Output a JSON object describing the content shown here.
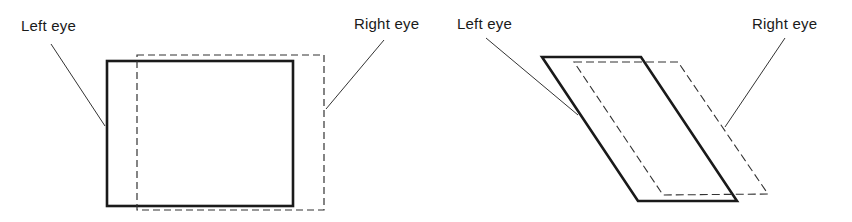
{
  "figures": [
    {
      "id": "rectangular",
      "left_label": "Left eye",
      "right_label": "Right eye"
    },
    {
      "id": "oblique",
      "left_label": "Left eye",
      "right_label": "Right eye"
    }
  ],
  "colors": {
    "line": "#1a1a1a",
    "background": "#ffffff"
  }
}
